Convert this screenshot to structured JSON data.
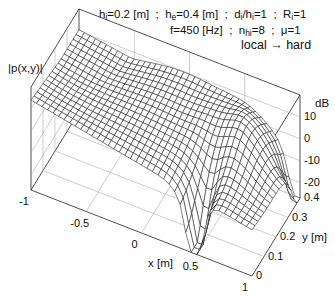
{
  "chart_data": {
    "type": "surface3d",
    "title_lines": [
      "h_i=0.2 [m]  ;  h_e=0.4 [m]  ;  d_i/h_i=1  ;  R_i=1",
      "f=450 [Hz]  ;  n_hi=8  ;  μ=1",
      "local → hard"
    ],
    "params": {
      "h_i": "0.2 [m]",
      "h_e": "0.4 [m]",
      "d_i_over_h_i": "1",
      "R_i": "1",
      "f": "450 [Hz]",
      "n_hi": "8",
      "mu": "1",
      "condition": "local → hard"
    },
    "zlabel": "|p(x,y)|",
    "zunit": "dB",
    "xlabel": "x [m]",
    "ylabel": "y [m]",
    "xlim": [
      -1,
      1
    ],
    "ylim": [
      0,
      0.4
    ],
    "zlim": [
      -27,
      20
    ],
    "xticks": [
      "-1",
      "-0.5",
      "0",
      "0.5",
      "1"
    ],
    "yticks": [
      "0",
      "0.1",
      "0.2",
      "0.3",
      "0.4"
    ],
    "zticks": [
      "10",
      "0",
      "-10",
      "-20"
    ],
    "grid": true
  },
  "labels": {
    "line1": {
      "h": "h",
      "hi_sub": "i",
      "hi_val": "=0.2 [m]  ;  ",
      "he": "h",
      "he_sub": "e",
      "he_val": "=0.4 [m]  ;  ",
      "d": "d",
      "d_sub": "i",
      "dh": "/h",
      "dh_sub": "i",
      "dh_val": "=1  ;  ",
      "R": "R",
      "R_sub": "i",
      "R_val": "=1"
    },
    "line2": {
      "f": "f=450 [Hz]  ;  ",
      "n": "n",
      "n_sub": "hi",
      "n_val": "=8  ;  ",
      "mu": "μ=1"
    },
    "line3": "local → hard",
    "zaxis": "|p(x,y)|",
    "zunit": "dB",
    "xaxis": "x [m]",
    "yaxis": "y [m]"
  }
}
